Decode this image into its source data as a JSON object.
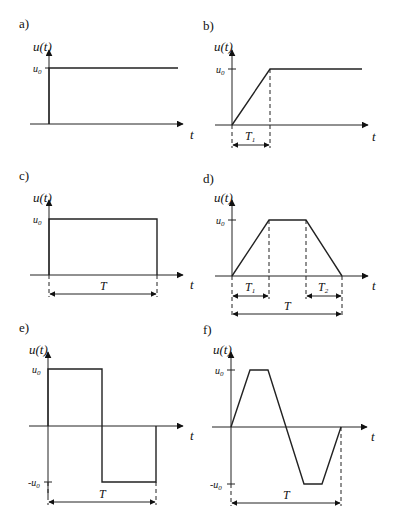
{
  "panels": [
    {
      "id": "a",
      "label": "a)",
      "y_label": "u(t)",
      "x_label": "t",
      "levels": [
        "u0"
      ],
      "description": "Step function of amplitude u0 at t=0"
    },
    {
      "id": "b",
      "label": "b)",
      "y_label": "u(t)",
      "x_label": "t",
      "levels": [
        "u0"
      ],
      "intervals": [
        "T1"
      ],
      "description": "Ramp from 0 to u0 over T1, then constant"
    },
    {
      "id": "c",
      "label": "c)",
      "y_label": "u(t)",
      "x_label": "t",
      "levels": [
        "u0"
      ],
      "intervals": [
        "T"
      ],
      "description": "Rectangular pulse of amplitude u0 and duration T"
    },
    {
      "id": "d",
      "label": "d)",
      "y_label": "u(t)",
      "x_label": "t",
      "levels": [
        "u0"
      ],
      "intervals": [
        "T1",
        "T2",
        "T"
      ],
      "description": "Trapezoidal pulse: rise T1, fall T2, total T"
    },
    {
      "id": "e",
      "label": "e)",
      "y_label": "u(t)",
      "x_label": "t",
      "levels": [
        "u0",
        "-u0"
      ],
      "intervals": [
        "T"
      ],
      "description": "Bipolar rectangular pulse, +u0 then -u0, period T"
    },
    {
      "id": "f",
      "label": "f)",
      "y_label": "u(t)",
      "x_label": "t",
      "levels": [
        "u0",
        "-u0"
      ],
      "intervals": [
        "T"
      ],
      "description": "Bipolar trapezoidal pulse, period T"
    }
  ],
  "text": {
    "a": {
      "label": "a)",
      "u": "u",
      "t_paren": "(t)",
      "u0": "u",
      "u0_sub": "0",
      "t": "t"
    },
    "b": {
      "label": "b)",
      "u": "u",
      "t_paren": "(t)",
      "u0": "u",
      "u0_sub": "0",
      "t": "t",
      "T1": "T",
      "T1_sub": "1"
    },
    "c": {
      "label": "c)",
      "u": "u",
      "t_paren": "(t)",
      "u0": "u",
      "u0_sub": "0",
      "t": "t",
      "T": "T"
    },
    "d": {
      "label": "d)",
      "u": "u",
      "t_paren": "(t)",
      "u0": "u",
      "u0_sub": "0",
      "t": "t",
      "T1": "T",
      "T1_sub": "1",
      "T2": "T",
      "T2_sub": "2",
      "T": "T"
    },
    "e": {
      "label": "e)",
      "u": "u",
      "t_paren": "(t)",
      "u0": "u",
      "u0_sub": "0",
      "neg_u0": "-u",
      "neg_u0_sub": "0",
      "t": "t",
      "T": "T"
    },
    "f": {
      "label": "f)",
      "u": "u",
      "t_paren": "(t)",
      "u0": "u",
      "u0_sub": "0",
      "neg_u0": "-u",
      "neg_u0_sub": "0",
      "t": "t",
      "T": "T"
    }
  }
}
